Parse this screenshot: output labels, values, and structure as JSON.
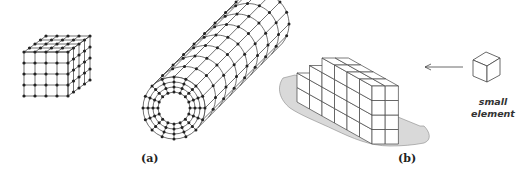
{
  "figure": {
    "panel_a": {
      "label": "(a)",
      "items": [
        {
          "name": "cube-mesh",
          "elements_per_edge": 4,
          "nodes_per_edge": 5
        },
        {
          "name": "hollow-cylinder-mesh",
          "rings": 4,
          "radial_layers": 3,
          "circumferential_nodes": 16,
          "axial_sections": 8
        }
      ]
    },
    "panel_b": {
      "label": "(b)",
      "structure": "stacked small cubic elements on a shaded base",
      "callout": {
        "line1": "small",
        "line2": "element"
      }
    },
    "colors": {
      "line": "#333333",
      "node": "#222222",
      "base_fill": "#d8d8d8",
      "background": "#ffffff"
    }
  }
}
